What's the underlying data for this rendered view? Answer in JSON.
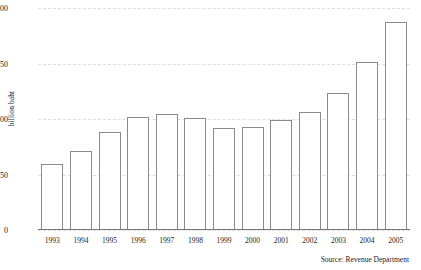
{
  "chart_data": {
    "type": "bar",
    "title": "",
    "subtitle": "",
    "xlabel": "",
    "ylabel": "billion baht",
    "categories": [
      "1993",
      "1994",
      "1995",
      "1996",
      "1997",
      "1998",
      "1999",
      "2000",
      "2001",
      "2002",
      "2003",
      "2004",
      "2005"
    ],
    "values": [
      297,
      356,
      443,
      511,
      522,
      504,
      459,
      463,
      495,
      530,
      617,
      757,
      937
    ],
    "ylim": [
      0,
      1000
    ],
    "yticks": [
      0,
      250,
      500,
      750,
      1000
    ],
    "ytick_labels": [
      "0",
      "250",
      "500",
      "750",
      "1000"
    ],
    "grid": true,
    "grid_style": "dashed",
    "grid_color": "#dddddd",
    "legend": null,
    "bar_fill_color": "#ffffff",
    "bar_border_color": "#8a8a8a",
    "axis_color": "#777777",
    "text_color": "#1b1b1b"
  },
  "annotations": {
    "source": "Source: Revenue Department"
  }
}
